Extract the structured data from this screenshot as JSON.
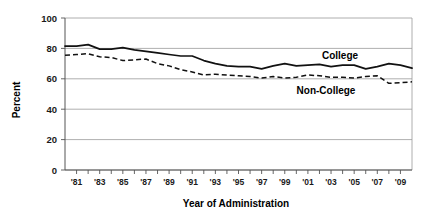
{
  "chart_data": {
    "type": "line",
    "title": "",
    "xlabel": "Year of Administration",
    "ylabel": "Percent",
    "ylim": [
      0,
      100
    ],
    "yticks": [
      0,
      20,
      40,
      60,
      80,
      100
    ],
    "ytick_labels": [
      "0",
      "20",
      "40",
      "60",
      "80",
      "100"
    ],
    "xlim": [
      1980,
      2010
    ],
    "grid": true,
    "legend_position": "inline-annotation",
    "x": [
      1980,
      1981,
      1982,
      1983,
      1984,
      1985,
      1986,
      1987,
      1988,
      1989,
      1990,
      1991,
      1992,
      1993,
      1994,
      1995,
      1996,
      1997,
      1998,
      1999,
      2000,
      2001,
      2002,
      2003,
      2004,
      2005,
      2006,
      2007,
      2008,
      2009,
      2010
    ],
    "xtick_labels": [
      "'81",
      "'83",
      "'85",
      "'87",
      "'89",
      "'91",
      "'93",
      "'95",
      "'97",
      "'99",
      "'01",
      "'03",
      "'05",
      "'07",
      "'09"
    ],
    "xtick_values": [
      1981,
      1983,
      1985,
      1987,
      1989,
      1991,
      1993,
      1995,
      1997,
      1999,
      2001,
      2003,
      2005,
      2007,
      2009
    ],
    "series": [
      {
        "name": "College",
        "style": "solid",
        "label": "College",
        "values": [
          81.5,
          81.5,
          82.5,
          79.5,
          79.5,
          80.5,
          79.0,
          78.0,
          77.0,
          76.0,
          75.0,
          75.0,
          72.0,
          70.0,
          68.5,
          68.0,
          68.0,
          66.5,
          68.5,
          70.0,
          68.5,
          69.0,
          69.5,
          68.0,
          69.0,
          69.0,
          66.5,
          68.0,
          70.0,
          69.0,
          67.0
        ]
      },
      {
        "name": "Non-College",
        "style": "dashed",
        "label": "Non-College",
        "values": [
          75.5,
          76.0,
          76.5,
          74.5,
          74.0,
          72.0,
          72.5,
          73.0,
          70.0,
          68.5,
          66.0,
          64.5,
          62.5,
          63.0,
          62.5,
          62.0,
          61.5,
          60.5,
          61.5,
          60.5,
          61.0,
          62.5,
          62.0,
          61.0,
          61.0,
          60.5,
          61.5,
          62.0,
          57.0,
          57.5,
          58.0
        ]
      }
    ]
  },
  "annotations": {
    "college_label": "College",
    "non_college_label": "Non-College"
  }
}
